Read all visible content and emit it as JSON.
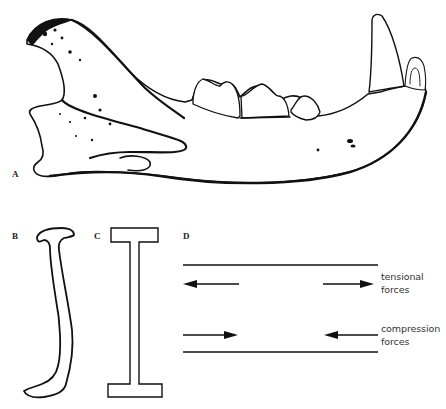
{
  "figure": {
    "panels": {
      "A": {
        "label": "A",
        "subject": "lower-jaw-lateral-view"
      },
      "B": {
        "label": "B",
        "subject": "jaw-cross-section"
      },
      "C": {
        "label": "C",
        "subject": "i-beam-cross-section"
      },
      "D": {
        "label": "D",
        "subject": "beam-force-diagram"
      }
    },
    "forces": {
      "tensional": {
        "line1": "tensional",
        "line2": "forces"
      },
      "compression": {
        "line1": "compression",
        "line2": "forces"
      }
    },
    "colors": {
      "ink": "#111111",
      "background": "#ffffff"
    }
  }
}
